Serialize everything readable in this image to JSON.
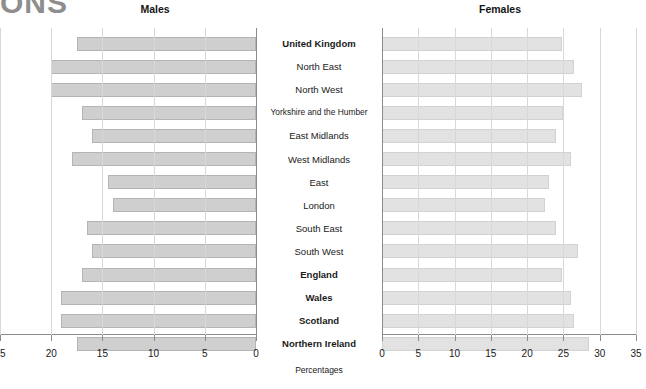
{
  "logo": {
    "text": "ONS"
  },
  "panels": {
    "left_title": "Males",
    "right_title": "Females"
  },
  "axis_title": "Percentages",
  "colors": {
    "bar_male": "#cfcfcf",
    "bar_female": "#e2e2e2",
    "grid": "#d8d8d8",
    "axis": "#8c8c8c"
  },
  "chart_data": {
    "type": "bar",
    "title": "",
    "subtitle": "",
    "orientation": "horizontal",
    "layout": "back-to-back population pyramid",
    "xlabel": "Percentages",
    "ylabel": "",
    "grid": true,
    "legend": "none",
    "categories": [
      "United Kingdom",
      "North East",
      "North West",
      "Yorkshire and the Humber",
      "East Midlands",
      "West Midlands",
      "East",
      "London",
      "South East",
      "South West",
      "England",
      "Wales",
      "Scotland",
      "Northern Ireland"
    ],
    "category_bold": [
      true,
      false,
      false,
      false,
      false,
      false,
      false,
      false,
      false,
      false,
      true,
      true,
      true,
      true
    ],
    "series": [
      {
        "name": "Males",
        "axis": "left",
        "direction": "reverse",
        "xlim": [
          0,
          25
        ],
        "xticks": [
          25,
          20,
          15,
          10,
          5,
          0
        ],
        "values": [
          17.5,
          20.0,
          20.0,
          17.0,
          16.0,
          18.0,
          14.5,
          14.0,
          16.5,
          16.0,
          17.0,
          19.0,
          19.0,
          17.5
        ]
      },
      {
        "name": "Females",
        "axis": "right",
        "direction": "forward",
        "xlim": [
          0,
          35
        ],
        "xticks": [
          0,
          5,
          10,
          15,
          20,
          25,
          30,
          35
        ],
        "values": [
          24.8,
          26.5,
          27.5,
          25.0,
          24.0,
          26.0,
          23.0,
          22.5,
          24.0,
          27.0,
          24.8,
          26.0,
          26.5,
          28.5
        ]
      }
    ]
  }
}
